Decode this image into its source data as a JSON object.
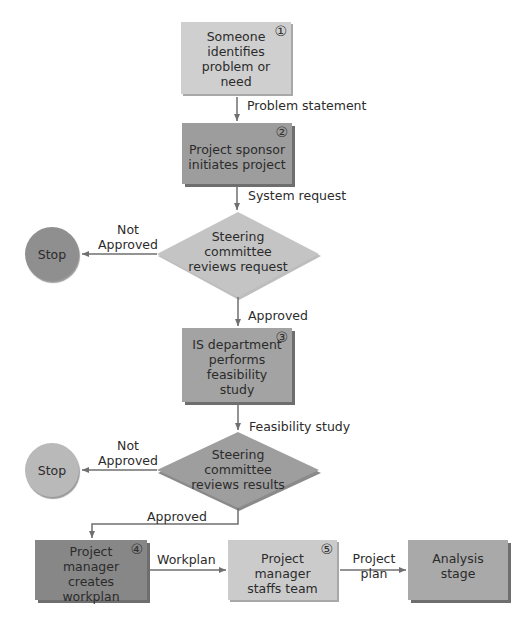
{
  "diagram": {
    "type": "flowchart",
    "colors": {
      "box1": "#cfcfcf",
      "box2": "#9d9d9d",
      "diamond1": "#c4c4c4",
      "box3": "#a3a3a3",
      "diamond2": "#9e9e9e",
      "box4": "#878787",
      "box5": "#cbcbcb",
      "analysis": "#a9a9a9",
      "stop1": "#8f8f8f",
      "stop2": "#b9b9b9",
      "line": "#6f6f6f"
    },
    "nodes": {
      "step1": {
        "number": "①",
        "lines": [
          "Someone",
          "identifies",
          "problem or need"
        ]
      },
      "step2": {
        "number": "②",
        "lines": [
          "Project sponsor",
          "initiates project"
        ]
      },
      "decision1": {
        "lines": [
          "Steering",
          "committee",
          "reviews request"
        ]
      },
      "stop1": {
        "label": "Stop"
      },
      "step3": {
        "number": "③",
        "lines": [
          "IS department",
          "performs",
          "feasibility study"
        ]
      },
      "decision2": {
        "lines": [
          "Steering",
          "committee",
          "reviews results"
        ]
      },
      "stop2": {
        "label": "Stop"
      },
      "step4": {
        "number": "④",
        "lines": [
          "Project manager",
          "creates workplan"
        ]
      },
      "step5": {
        "number": "⑤",
        "lines": [
          "Project manager",
          "staffs team"
        ]
      },
      "analysis": {
        "lines": [
          "Analysis",
          "stage"
        ]
      }
    },
    "edges": {
      "e1": {
        "label": "Problem statement"
      },
      "e2": {
        "label": "System request"
      },
      "e3_no": {
        "lines": [
          "Not",
          "Approved"
        ]
      },
      "e3_yes": {
        "label": "Approved"
      },
      "e4": {
        "label": "Feasibility study"
      },
      "e5_no": {
        "lines": [
          "Not",
          "Approved"
        ]
      },
      "e5_yes": {
        "label": "Approved"
      },
      "e6": {
        "label": "Workplan"
      },
      "e7": {
        "lines": [
          "Project",
          "plan"
        ]
      }
    }
  }
}
